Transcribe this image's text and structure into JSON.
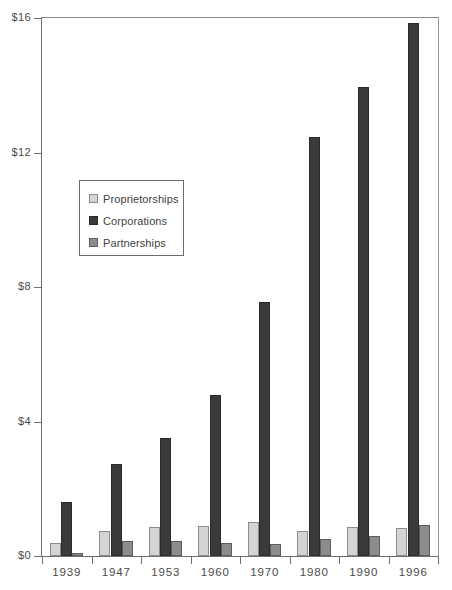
{
  "chart_data": {
    "type": "bar",
    "title": "",
    "subtitle": "",
    "xlabel": "",
    "ylabel": "",
    "categories": [
      "1939",
      "1947",
      "1953",
      "1960",
      "1970",
      "1980",
      "1990",
      "1996"
    ],
    "series": [
      {
        "name": "Proprietorships",
        "color": "#d4d4d4",
        "values": [
          0.4,
          0.73,
          0.85,
          0.9,
          1.0,
          0.75,
          0.85,
          0.83
        ]
      },
      {
        "name": "Corporations",
        "color": "#3a3a3a",
        "values": [
          1.6,
          2.75,
          3.5,
          4.8,
          7.55,
          12.45,
          13.95,
          15.85
        ]
      },
      {
        "name": "Partnerships",
        "color": "#8c8c8c",
        "values": [
          0.1,
          0.45,
          0.45,
          0.4,
          0.35,
          0.5,
          0.6,
          0.92
        ]
      }
    ],
    "ylim": [
      0,
      16
    ],
    "yticks": [
      0,
      4,
      8,
      12,
      16
    ],
    "ytick_labels": [
      "$0",
      "$4",
      "$8",
      "$12",
      "$16"
    ],
    "grid": false,
    "legend_position": "inside-upper-left"
  },
  "legend": {
    "entries": [
      {
        "label": "Proprietorships"
      },
      {
        "label": "Corporations"
      },
      {
        "label": "Partnerships"
      }
    ]
  },
  "colors": {
    "proprietorships": "#d4d4d4",
    "corporations": "#3a3a3a",
    "partnerships": "#8c8c8c",
    "axis": "#6f6f6f",
    "text": "#4a4a4a",
    "background": "#ffffff"
  }
}
